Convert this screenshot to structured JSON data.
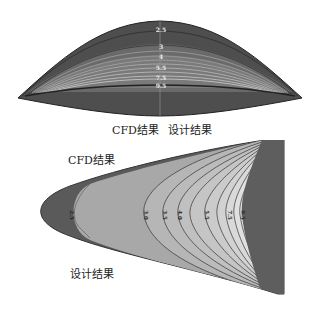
{
  "figure_top": {
    "view": "front",
    "contour_labels": [
      "2.5",
      "3",
      "4",
      "5.5",
      "7.5",
      "9.5"
    ],
    "caption_left": "CFD结果",
    "caption_right": "设计结果"
  },
  "figure_bottom": {
    "view": "top",
    "contour_labels": [
      "2.5",
      "3.0",
      "3.5",
      "4.0",
      "5.5",
      "7.5",
      "9.5"
    ],
    "caption_top": "CFD结果",
    "caption_bottom": "设计结果"
  },
  "colors": {
    "dark_body": "#555555",
    "mid_gray": "#8a8a8a",
    "light_gray": "#b8b8b8",
    "contour_line": "#3a3a3a",
    "highlight": "#e8e8e8"
  }
}
